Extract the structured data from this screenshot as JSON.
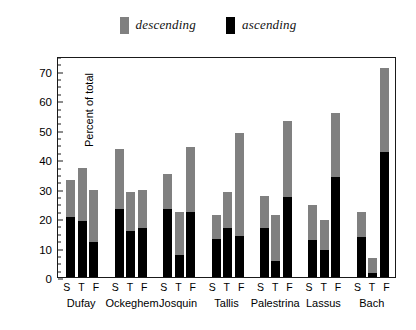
{
  "chart_data": {
    "type": "bar",
    "subtype": "stacked-grouped",
    "title": "",
    "xlabel": "",
    "ylabel": "Percent of total",
    "ylim": [
      0,
      75
    ],
    "ytick_values": [
      0,
      10,
      20,
      30,
      40,
      50,
      60,
      70
    ],
    "ytick_labels": [
      "0",
      "10",
      "20",
      "30",
      "40",
      "50",
      "60",
      "70"
    ],
    "yminor_step": 2.5,
    "grid": false,
    "legend_position": "above-plot-center",
    "legend": [
      {
        "label": "descending",
        "color": "#808080"
      },
      {
        "label": "ascending",
        "color": "#000000"
      }
    ],
    "categories": [
      "Dufay",
      "Ockeghem",
      "Josquin",
      "Tallis",
      "Palestrina",
      "Lassus",
      "Bach"
    ],
    "subcategories": [
      "S",
      "T",
      "F"
    ],
    "subcategory_labels_full": [
      "S",
      "T",
      "F"
    ],
    "series": [
      {
        "name": "ascending",
        "color": "#000000",
        "values": [
          [
            20.5,
            19.0,
            12.0
          ],
          [
            23.0,
            15.5,
            16.5
          ],
          [
            23.0,
            7.5,
            22.0
          ],
          [
            13.0,
            16.5,
            14.0
          ],
          [
            16.5,
            5.5,
            27.0
          ],
          [
            12.5,
            9.0,
            34.0
          ],
          [
            13.5,
            1.5,
            42.5
          ]
        ]
      },
      {
        "name": "descending",
        "color": "#808080",
        "values": [
          [
            12.5,
            18.0,
            17.5
          ],
          [
            20.5,
            13.5,
            13.0
          ],
          [
            12.0,
            14.5,
            22.0
          ],
          [
            8.0,
            12.5,
            35.0
          ],
          [
            11.0,
            15.5,
            26.0
          ],
          [
            12.0,
            10.5,
            21.5
          ],
          [
            8.5,
            5.0,
            28.5
          ]
        ]
      }
    ],
    "totals": [
      [
        33.0,
        37.0,
        29.5
      ],
      [
        43.5,
        29.0,
        29.5
      ],
      [
        35.0,
        22.0,
        44.0
      ],
      [
        21.0,
        29.0,
        49.0
      ],
      [
        27.5,
        21.0,
        53.0
      ],
      [
        24.5,
        19.5,
        55.5
      ],
      [
        22.0,
        6.5,
        71.0
      ]
    ]
  }
}
